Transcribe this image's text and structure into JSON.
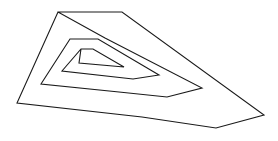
{
  "figure": {
    "background_color": "#ffffff",
    "stroke_color": "#1a1a1a",
    "stroke_width": 1.1,
    "width": 278,
    "height": 141
  },
  "chart_data": {
    "type": "line",
    "xlabel": "",
    "ylabel": "",
    "grid": false,
    "legend": false,
    "xlim": [
      0,
      278
    ],
    "ylim": [
      0,
      141
    ],
    "turns": 2.5,
    "winding": "counterclockwise-inward",
    "series": [
      {
        "name": "spiral-outline",
        "closed": false,
        "points": [
          [
            58,
            12
          ],
          [
            122,
            12
          ],
          [
            264,
            115
          ],
          [
            216,
            128
          ],
          [
            142,
            117
          ],
          [
            17,
            103
          ],
          [
            58,
            12
          ],
          [
            105,
            38
          ],
          [
            202,
            88
          ],
          [
            167,
            97
          ],
          [
            119,
            92
          ],
          [
            41,
            84
          ],
          [
            70,
            39
          ],
          [
            98,
            39
          ],
          [
            159,
            75
          ],
          [
            133,
            79
          ],
          [
            62,
            71
          ],
          [
            81,
            49
          ],
          [
            93,
            49
          ],
          [
            124,
            67
          ],
          [
            79,
            63
          ],
          [
            81,
            49
          ]
        ]
      }
    ]
  }
}
